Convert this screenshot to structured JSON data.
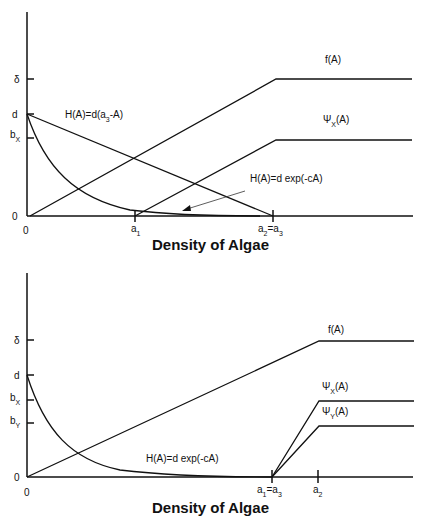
{
  "panels": [
    {
      "id": "top",
      "x_axis_title": "Density of Algae",
      "y_ticks": {
        "delta": "δ",
        "d": "d",
        "bX_main": "b",
        "bX_sub": "X",
        "zero": "0"
      },
      "x_ticks": {
        "zero": "0",
        "a1_main": "a",
        "a1_sub": "1",
        "a2a3_main_1": "a",
        "a2a3_sub_1": "2",
        "a2a3_eq": "=a",
        "a2a3_sub_2": "3"
      },
      "curve_labels": {
        "f": "f(A)",
        "psiX_main": "Ψ",
        "psiX_sub": "X",
        "psiX_tail": "(A)",
        "H_linear_main": "H(A)=d(a",
        "H_linear_sub": "3",
        "H_linear_tail": "-A)",
        "H_exp": "H(A)=d exp(-cA)"
      }
    },
    {
      "id": "bottom",
      "x_axis_title": "Density of Algae",
      "y_ticks": {
        "delta": "δ",
        "d": "d",
        "bX_main": "b",
        "bX_sub": "X",
        "bY_main": "b",
        "bY_sub": "Y",
        "zero": "0"
      },
      "x_ticks": {
        "zero": "0",
        "a1a3_main_1": "a",
        "a1a3_sub_1": "1",
        "a1a3_eq": "=a",
        "a1a3_sub_2": "3",
        "a2_main": "a",
        "a2_sub": "2"
      },
      "curve_labels": {
        "f": "f(A)",
        "psiX_main": "Ψ",
        "psiX_sub": "X",
        "psiX_tail": "(A)",
        "psiY_main": "Ψ",
        "psiY_sub": "Y",
        "psiY_tail": "(A)",
        "H_exp": "H(A)=d exp(-cA)"
      }
    }
  ]
}
